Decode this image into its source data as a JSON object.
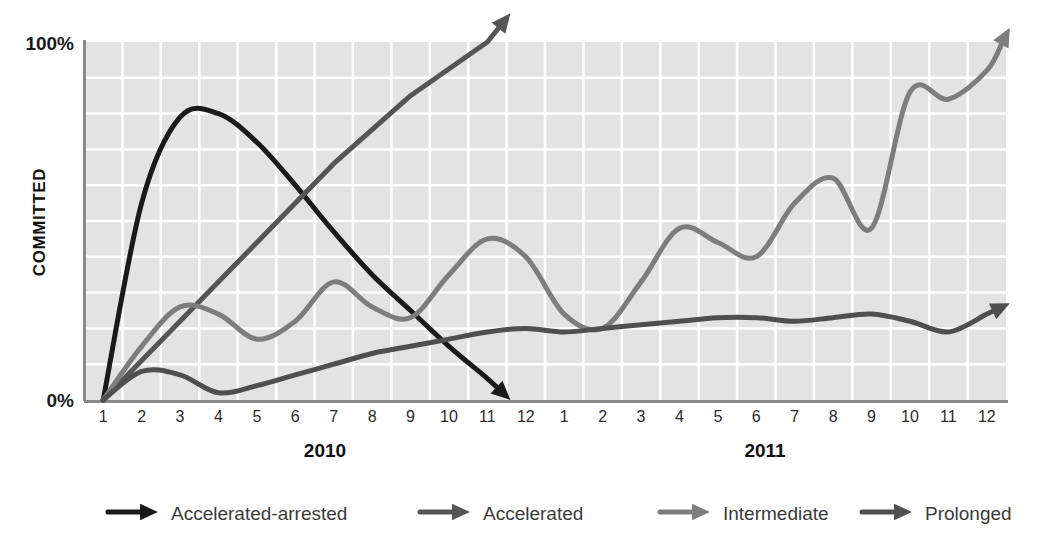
{
  "chart_data": {
    "type": "line",
    "title": "",
    "xlabel": "",
    "ylabel": "COMMITTED",
    "ylim": [
      0,
      100
    ],
    "ytick_labels": [
      "0%",
      "100%"
    ],
    "grid": true,
    "legend_position": "bottom",
    "x_axis": {
      "groups": [
        {
          "label": "2010",
          "ticks": [
            "1",
            "2",
            "3",
            "4",
            "5",
            "6",
            "7",
            "8",
            "9",
            "10",
            "11",
            "12"
          ]
        },
        {
          "label": "2011",
          "ticks": [
            "1",
            "2",
            "3",
            "4",
            "5",
            "6",
            "7",
            "8",
            "9",
            "10",
            "11",
            "12"
          ]
        }
      ]
    },
    "series": [
      {
        "name": "Accelerated-arrested",
        "color": "#1a1a1a",
        "x": [
          1,
          2,
          3,
          4,
          5,
          6,
          7,
          8,
          9,
          10,
          11,
          11.6
        ],
        "values": [
          0,
          55,
          79,
          80,
          72,
          60,
          47,
          35,
          25,
          15,
          6,
          0
        ],
        "end_marker": "arrow-down-right"
      },
      {
        "name": "Accelerated",
        "color": "#555555",
        "x": [
          1,
          3,
          5,
          7,
          9,
          11,
          11.6
        ],
        "values": [
          0,
          22,
          44,
          66,
          85,
          100,
          108
        ],
        "end_marker": "arrow-up-right"
      },
      {
        "name": "Intermediate",
        "color": "#7d7d7d",
        "x": [
          1,
          2,
          3,
          4,
          5,
          6,
          7,
          8,
          9,
          10,
          11,
          12,
          13,
          14,
          15,
          16,
          17,
          18,
          19,
          20,
          21,
          22,
          23,
          24,
          24.6
        ],
        "values": [
          0,
          15,
          26,
          24,
          17,
          22,
          33,
          26,
          23,
          35,
          45,
          40,
          24,
          20,
          33,
          48,
          44,
          40,
          55,
          62,
          48,
          86,
          84,
          92,
          104
        ],
        "end_marker": "arrow-up-right"
      },
      {
        "name": "Prolonged",
        "color": "#4f4f4f",
        "x": [
          1,
          2,
          3,
          4,
          5,
          6,
          7,
          8,
          9,
          10,
          11,
          12,
          13,
          14,
          15,
          16,
          17,
          18,
          19,
          20,
          21,
          22,
          23,
          24,
          24.6
        ],
        "values": [
          0,
          8,
          7,
          2,
          4,
          7,
          10,
          13,
          15,
          17,
          19,
          20,
          19,
          20,
          21,
          22,
          23,
          23,
          22,
          23,
          24,
          22,
          19,
          24,
          27
        ],
        "end_marker": "arrow-up-right"
      }
    ],
    "legend": [
      {
        "label": "Accelerated-arrested",
        "color": "#1a1a1a"
      },
      {
        "label": "Accelerated",
        "color": "#555555"
      },
      {
        "label": "Intermediate",
        "color": "#7d7d7d"
      },
      {
        "label": "Prolonged",
        "color": "#4f4f4f"
      }
    ],
    "colors": {
      "plot_background": "#e3e3e3",
      "gridline": "#ffffff",
      "axis_line": "#8a8a8a",
      "text": "#1a1a1a"
    }
  }
}
